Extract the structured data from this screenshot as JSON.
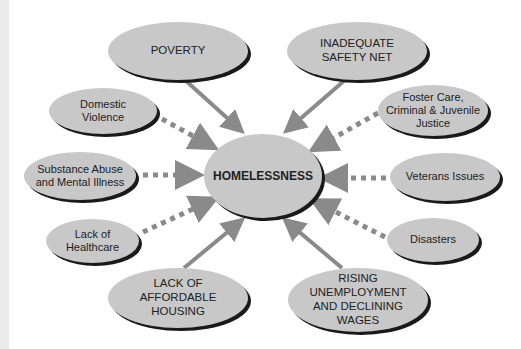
{
  "diagram": {
    "center": {
      "label": "HOMELESSNESS"
    },
    "causes": [
      {
        "id": "poverty",
        "label": "POVERTY",
        "type": "major"
      },
      {
        "id": "safety-net",
        "label": "INADEQUATE\nSAFETY NET",
        "type": "major"
      },
      {
        "id": "domestic-violence",
        "label": "Domestic\nViolence",
        "type": "minor"
      },
      {
        "id": "foster-care",
        "label": "Foster Care,\nCriminal & Juvenile\nJustice",
        "type": "minor"
      },
      {
        "id": "substance-abuse",
        "label": "Substance Abuse\nand Mental Illness",
        "type": "minor"
      },
      {
        "id": "veterans",
        "label": "Veterans Issues",
        "type": "minor"
      },
      {
        "id": "healthcare",
        "label": "Lack of\nHealthcare",
        "type": "minor"
      },
      {
        "id": "disasters",
        "label": "Disasters",
        "type": "minor"
      },
      {
        "id": "housing",
        "label": "LACK OF\nAFFORDABLE\nHOUSING",
        "type": "major"
      },
      {
        "id": "unemployment",
        "label": "RISING\nUNEMPLOYMENT\nAND DECLINING\nWAGES",
        "type": "major"
      }
    ],
    "legend": {
      "solid_arrow": "major cause",
      "dashed_arrow": "contributing factor"
    },
    "colors": {
      "node_fill": "#c8c8c8",
      "arrow": "#8a8a8a",
      "shadow": "#1a1a1a"
    }
  }
}
